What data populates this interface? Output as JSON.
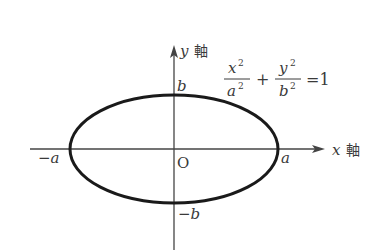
{
  "diagram": {
    "type": "ellipse",
    "equation": {
      "term1_num": "x",
      "term1_num_exp": "2",
      "term1_den": "a",
      "term1_den_exp": "2",
      "plus": "+",
      "term2_num": "y",
      "term2_num_exp": "2",
      "term2_den": "b",
      "term2_den_exp": "2",
      "equals": "=1"
    },
    "axes": {
      "x_label": "x",
      "x_suffix": "軸",
      "y_label": "y",
      "y_suffix": "軸",
      "origin": "O"
    },
    "points": {
      "pos_a": "a",
      "neg_a": "−a",
      "pos_b": "b",
      "neg_b": "−b"
    },
    "colors": {
      "stroke": "#1a1a1a",
      "axis": "#444444",
      "text": "#3a3a3a"
    }
  }
}
